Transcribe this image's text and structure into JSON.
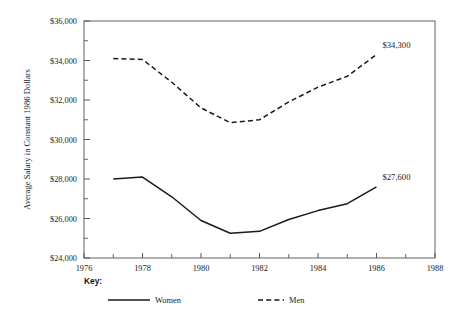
{
  "chart_data": {
    "type": "line",
    "title": "",
    "subtitle": "",
    "xlabel": "",
    "ylabel": "Average Salary in Constant 1986 Dollars",
    "xlim": [
      1976,
      1988
    ],
    "ylim": [
      24000,
      36000
    ],
    "x_tick_labels": [
      "1976",
      "1978",
      "1980",
      "1982",
      "1984",
      "1986",
      "1988"
    ],
    "x_ticks": [
      1976,
      1978,
      1980,
      1982,
      1984,
      1986,
      1988
    ],
    "x_minor_ticks": [
      1977,
      1979,
      1981,
      1983,
      1985,
      1987
    ],
    "y_tick_labels": [
      "$24,000",
      "$26,000",
      "$28,000",
      "$30,000",
      "$32,000",
      "$34,000",
      "$36,000"
    ],
    "y_ticks": [
      24000,
      26000,
      28000,
      30000,
      32000,
      34000,
      36000
    ],
    "y_minor_ticks": [
      25000,
      27000,
      29000,
      31000,
      33000,
      35000
    ],
    "grid": false,
    "legend_position": "bottom",
    "x": [
      1977,
      1978,
      1979,
      1980,
      1981,
      1982,
      1983,
      1984,
      1985,
      1986
    ],
    "series": [
      {
        "name": "Women",
        "style": "solid",
        "color": "#1a1a1a",
        "values": [
          28000,
          28100,
          27100,
          25900,
          25250,
          25350,
          25950,
          26400,
          26750,
          27600
        ]
      },
      {
        "name": "Men",
        "style": "dashed",
        "color": "#1a1a1a",
        "values": [
          34100,
          34050,
          32900,
          31600,
          30850,
          31000,
          31900,
          32650,
          33200,
          34300
        ]
      }
    ],
    "annotations": [
      {
        "text": "$34,300",
        "series": "Men",
        "x": 1986,
        "y": 34300
      },
      {
        "text": "$27,600",
        "series": "Women",
        "x": 1986,
        "y": 27600
      }
    ]
  },
  "legend": {
    "title": "Key:",
    "items": [
      {
        "label": "Women",
        "style": "solid"
      },
      {
        "label": "Men",
        "style": "dashed"
      }
    ]
  }
}
